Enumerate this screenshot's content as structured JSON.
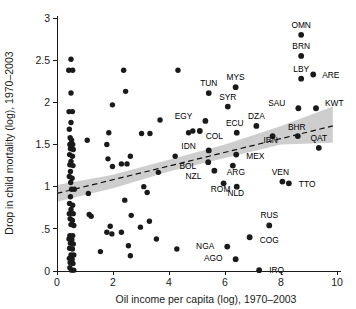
{
  "chart_data": {
    "type": "scatter",
    "title": "",
    "xlabel": "Oil income per capita (log), 1970–2003",
    "ylabel": "Drop in child mortality (log), 1970–2003",
    "xlim": [
      -0.35,
      10.6
    ],
    "ylim": [
      -0.12,
      3.12
    ],
    "xticks": [
      0,
      2,
      4,
      6,
      8,
      10
    ],
    "xticklabels": [
      "0",
      "2",
      "4",
      "6",
      "8",
      "10"
    ],
    "yticks": [
      0,
      0.5,
      1,
      1.5,
      2,
      2.5,
      3
    ],
    "yticklabels": [
      "0",
      ".5",
      "1",
      "1.5",
      "2",
      "2.5",
      "3"
    ],
    "grid": false,
    "legend": "none",
    "marker_color": "#1a1a1a",
    "band_color": "#bdbdbd",
    "fit_line_color": "#111111",
    "fit_line_style": "dashed",
    "fit_line": {
      "x_start": 0.0,
      "y_start": 0.92,
      "x_end": 9.85,
      "y_end": 1.72
    },
    "confidence_band": {
      "x": [
        0.0,
        2.0,
        4.0,
        6.0,
        8.0,
        9.85
      ],
      "upper": [
        1.02,
        1.14,
        1.32,
        1.5,
        1.72,
        1.95
      ],
      "lower": [
        0.82,
        0.98,
        1.18,
        1.34,
        1.5,
        1.52
      ]
    },
    "labeled_points": [
      {
        "label": "OMN",
        "x": 8.72,
        "y": 2.8,
        "label_dx": 0,
        "label_dy": -7
      },
      {
        "label": "BRN",
        "x": 8.72,
        "y": 2.55,
        "label_dx": 0,
        "label_dy": -7
      },
      {
        "label": "LBY",
        "x": 8.72,
        "y": 2.28,
        "label_dx": 0,
        "label_dy": -7
      },
      {
        "label": "ARE",
        "x": 9.15,
        "y": 2.33,
        "label_dx": 9,
        "label_dy": 3
      },
      {
        "label": "MYS",
        "x": 6.38,
        "y": 2.18,
        "label_dx": 0,
        "label_dy": -7
      },
      {
        "label": "TUN",
        "x": 5.42,
        "y": 2.11,
        "label_dx": 0,
        "label_dy": -7
      },
      {
        "label": "SYR",
        "x": 6.1,
        "y": 1.95,
        "label_dx": 0,
        "label_dy": -7
      },
      {
        "label": "SAU",
        "x": 8.62,
        "y": 1.93,
        "label_dx": -13,
        "label_dy": -2
      },
      {
        "label": "KWT",
        "x": 9.25,
        "y": 1.93,
        "label_dx": 9,
        "label_dy": -2
      },
      {
        "label": "EGY",
        "x": 5.3,
        "y": 1.78,
        "label_dx": -13,
        "label_dy": -2
      },
      {
        "label": "DZA",
        "x": 7.12,
        "y": 1.72,
        "label_dx": 0,
        "label_dy": -7
      },
      {
        "label": "ECU",
        "x": 6.42,
        "y": 1.64,
        "label_dx": -2,
        "label_dy": -7
      },
      {
        "label": "COL",
        "x": 5.1,
        "y": 1.66,
        "label_dx": 6,
        "label_dy": 8
      },
      {
        "label": "IRN",
        "x": 7.7,
        "y": 1.6,
        "label_dx": -2,
        "label_dy": 7
      },
      {
        "label": "BHR",
        "x": 8.6,
        "y": 1.6,
        "label_dx": -1,
        "label_dy": -6
      },
      {
        "label": "QAT",
        "x": 9.35,
        "y": 1.46,
        "label_dx": 0,
        "label_dy": -7
      },
      {
        "label": "IDN",
        "x": 5.42,
        "y": 1.43,
        "label_dx": -13,
        "label_dy": -1
      },
      {
        "label": "MEX",
        "x": 6.4,
        "y": 1.38,
        "label_dx": 10,
        "label_dy": 4
      },
      {
        "label": "BOL",
        "x": 5.4,
        "y": 1.29,
        "label_dx": -12,
        "label_dy": 7
      },
      {
        "label": "ARG",
        "x": 6.28,
        "y": 1.25,
        "label_dx": 3,
        "label_dy": 9
      },
      {
        "label": "NZL",
        "x": 5.62,
        "y": 1.19,
        "label_dx": -13,
        "label_dy": 8
      },
      {
        "label": "VEN",
        "x": 8.05,
        "y": 1.06,
        "label_dx": -2,
        "label_dy": -7
      },
      {
        "label": "TTO",
        "x": 8.28,
        "y": 1.04,
        "label_dx": 10,
        "label_dy": 4
      },
      {
        "label": "ROM",
        "x": 5.95,
        "y": 1.04,
        "label_dx": -3,
        "label_dy": 9
      },
      {
        "label": "NLD",
        "x": 6.42,
        "y": 1.0,
        "label_dx": -1,
        "label_dy": 9
      },
      {
        "label": "RUS",
        "x": 7.58,
        "y": 0.54,
        "label_dx": 0,
        "label_dy": -7
      },
      {
        "label": "COG",
        "x": 6.88,
        "y": 0.4,
        "label_dx": 10,
        "label_dy": 6
      },
      {
        "label": "NGA",
        "x": 6.08,
        "y": 0.29,
        "label_dx": -13,
        "label_dy": 2
      },
      {
        "label": "AGO",
        "x": 6.38,
        "y": 0.14,
        "label_dx": -13,
        "label_dy": 2
      },
      {
        "label": "IRQ",
        "x": 7.22,
        "y": 0.01,
        "label_dx": 10,
        "label_dy": 3
      }
    ],
    "unlabeled_points": [
      {
        "x": 0.5,
        "y": 2.51
      },
      {
        "x": 0.42,
        "y": 2.38
      },
      {
        "x": 0.56,
        "y": 2.38
      },
      {
        "x": 2.38,
        "y": 2.38
      },
      {
        "x": 4.32,
        "y": 2.38
      },
      {
        "x": 0.5,
        "y": 2.11
      },
      {
        "x": 2.45,
        "y": 2.13
      },
      {
        "x": 1.98,
        "y": 1.97
      },
      {
        "x": 0.43,
        "y": 1.89
      },
      {
        "x": 0.55,
        "y": 1.89
      },
      {
        "x": 3.68,
        "y": 1.79
      },
      {
        "x": 0.5,
        "y": 1.76
      },
      {
        "x": 0.44,
        "y": 1.68
      },
      {
        "x": 1.85,
        "y": 1.64
      },
      {
        "x": 3.02,
        "y": 1.63
      },
      {
        "x": 3.32,
        "y": 1.63
      },
      {
        "x": 4.7,
        "y": 1.64
      },
      {
        "x": 4.85,
        "y": 1.66
      },
      {
        "x": 0.47,
        "y": 1.58
      },
      {
        "x": 0.52,
        "y": 1.55
      },
      {
        "x": 1.08,
        "y": 1.55
      },
      {
        "x": 0.46,
        "y": 1.5
      },
      {
        "x": 0.56,
        "y": 1.5
      },
      {
        "x": 0.48,
        "y": 1.45
      },
      {
        "x": 0.58,
        "y": 1.44
      },
      {
        "x": 1.78,
        "y": 1.5
      },
      {
        "x": 0.45,
        "y": 1.38
      },
      {
        "x": 0.55,
        "y": 1.36
      },
      {
        "x": 2.62,
        "y": 1.36
      },
      {
        "x": 4.22,
        "y": 1.36
      },
      {
        "x": 0.5,
        "y": 1.3
      },
      {
        "x": 1.82,
        "y": 1.33
      },
      {
        "x": 0.46,
        "y": 1.26
      },
      {
        "x": 0.57,
        "y": 1.25
      },
      {
        "x": 2.3,
        "y": 1.27
      },
      {
        "x": 2.5,
        "y": 1.27
      },
      {
        "x": 1.98,
        "y": 1.24
      },
      {
        "x": 0.48,
        "y": 1.18
      },
      {
        "x": 3.62,
        "y": 1.17
      },
      {
        "x": 0.44,
        "y": 1.12
      },
      {
        "x": 0.54,
        "y": 1.1
      },
      {
        "x": 0.49,
        "y": 1.05
      },
      {
        "x": 0.52,
        "y": 0.97
      },
      {
        "x": 0.62,
        "y": 0.97
      },
      {
        "x": 3.1,
        "y": 1.0
      },
      {
        "x": 1.12,
        "y": 0.92
      },
      {
        "x": 3.22,
        "y": 0.93
      },
      {
        "x": 0.48,
        "y": 0.88
      },
      {
        "x": 2.42,
        "y": 0.84
      },
      {
        "x": 0.45,
        "y": 0.8
      },
      {
        "x": 0.56,
        "y": 0.78
      },
      {
        "x": 0.5,
        "y": 0.73
      },
      {
        "x": 0.44,
        "y": 0.68
      },
      {
        "x": 0.58,
        "y": 0.68
      },
      {
        "x": 1.15,
        "y": 0.67
      },
      {
        "x": 1.22,
        "y": 0.65
      },
      {
        "x": 2.65,
        "y": 0.66
      },
      {
        "x": 0.47,
        "y": 0.62
      },
      {
        "x": 0.55,
        "y": 0.6
      },
      {
        "x": 3.3,
        "y": 0.59
      },
      {
        "x": 0.5,
        "y": 0.55
      },
      {
        "x": 0.6,
        "y": 0.54
      },
      {
        "x": 1.9,
        "y": 0.53
      },
      {
        "x": 2.98,
        "y": 0.52
      },
      {
        "x": 1.78,
        "y": 0.46
      },
      {
        "x": 2.3,
        "y": 0.46
      },
      {
        "x": 1.96,
        "y": 0.44
      },
      {
        "x": 0.46,
        "y": 0.42
      },
      {
        "x": 0.56,
        "y": 0.42
      },
      {
        "x": 0.43,
        "y": 0.38
      },
      {
        "x": 0.53,
        "y": 0.37
      },
      {
        "x": 3.55,
        "y": 0.38
      },
      {
        "x": 0.48,
        "y": 0.33
      },
      {
        "x": 0.58,
        "y": 0.32
      },
      {
        "x": 2.55,
        "y": 0.3
      },
      {
        "x": 0.45,
        "y": 0.27
      },
      {
        "x": 0.55,
        "y": 0.26
      },
      {
        "x": 4.28,
        "y": 0.26
      },
      {
        "x": 1.55,
        "y": 0.23
      },
      {
        "x": 0.5,
        "y": 0.19
      },
      {
        "x": 0.6,
        "y": 0.19
      },
      {
        "x": 0.44,
        "y": 0.15
      },
      {
        "x": 0.54,
        "y": 0.14
      },
      {
        "x": 2.62,
        "y": 0.18
      },
      {
        "x": 0.47,
        "y": 0.1
      },
      {
        "x": 0.57,
        "y": 0.09
      },
      {
        "x": 0.46,
        "y": 0.04
      },
      {
        "x": 0.52,
        "y": 0.01
      },
      {
        "x": 0.6,
        "y": 0.01
      }
    ]
  }
}
